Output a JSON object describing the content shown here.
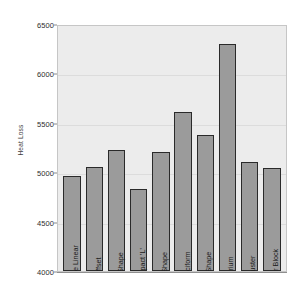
{
  "chart_data": {
    "type": "bar",
    "title": "",
    "xlabel": "",
    "ylabel": "Heat Loss",
    "ylim": [
      4000,
      6500
    ],
    "ytick_step": 500,
    "yticks": [
      "6500",
      "6000",
      "5500",
      "5000",
      "4500",
      "4000"
    ],
    "grid": true,
    "legend": "none",
    "label_placement": "rotated-inside-bars",
    "categories": [
      "Simple Linear",
      "Offset",
      "'L' Shape",
      "Compact 'L'",
      "'T' Shape",
      "Cruciform",
      "'U' Shape",
      "Atrium",
      "Cluster",
      "Poinr Block"
    ],
    "values": [
      4960,
      5050,
      5220,
      4830,
      5200,
      5610,
      5380,
      6300,
      5100,
      5040
    ]
  },
  "colors": {
    "bar_fill": "#9b9b9b",
    "bar_border": "#2a2a2a",
    "plot_background": "#ececec",
    "gridline": "#dcdcdc",
    "axis_text": "#2e2e2e",
    "page_background": "#ffffff"
  }
}
